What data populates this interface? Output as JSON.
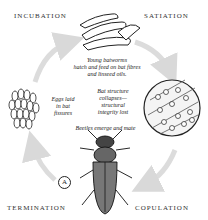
{
  "diagram": {
    "stages": [
      {
        "id": "incubation",
        "label": "INCUBATION"
      },
      {
        "id": "satiation",
        "label": "SATIATION"
      },
      {
        "id": "copulation",
        "label": "COPULATION"
      },
      {
        "id": "termination",
        "label": "TERMINATION"
      }
    ],
    "captions": {
      "larvae": [
        "Young batworms",
        "hatch and feed on bat fibres",
        "and linseed oils."
      ],
      "collapse": [
        "Bat structure",
        "collapses—",
        "structural",
        "integrity lost"
      ],
      "eggs": [
        "Eggs laid",
        "in bat",
        "fissures"
      ],
      "beetles": "Beetles emerge and mate"
    },
    "marker": "A",
    "colors": {
      "arrow": "#d9d9d9",
      "ink": "#1a1a1a"
    }
  }
}
